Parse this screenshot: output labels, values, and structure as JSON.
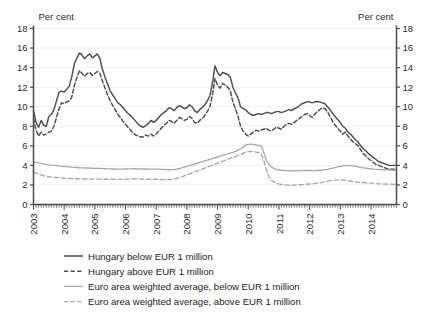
{
  "chart_data": {
    "type": "line",
    "title": "",
    "xlabel": "",
    "ylabel": "Per cent",
    "ylabel_left": "Per cent",
    "ylabel_right": "Per cent",
    "ylim": [
      0,
      18
    ],
    "ytick_values": [
      0,
      2,
      4,
      6,
      8,
      10,
      12,
      14,
      16,
      18
    ],
    "ytick_labels": [
      "0",
      "2",
      "4",
      "6",
      "8",
      "10",
      "12",
      "14",
      "16",
      "18"
    ],
    "xlim": [
      2003.0,
      2014.83
    ],
    "xtick_labels": [
      "2003",
      "2004",
      "2005",
      "2006",
      "2007",
      "2008",
      "2009",
      "2010",
      "2011",
      "2012",
      "2013",
      "2014"
    ],
    "xtick_values": [
      2003,
      2004,
      2005,
      2006,
      2007,
      2008,
      2009,
      2010,
      2011,
      2012,
      2013,
      2014
    ],
    "grid": true,
    "grid_axis": "y",
    "legend_position": "below",
    "x_minor_ticks": "monthly",
    "colors": {
      "hungary": "#4d4d4d",
      "euro_area": "#a8a8a8",
      "axis": "#4a4a4a",
      "grid": "#f0f0f0",
      "text": "#1c1c1c"
    },
    "series": [
      {
        "name": "Hungary below EUR 1 million",
        "color": "#4d4d4d",
        "style": "solid",
        "values": [
          9.6,
          8.4,
          7.9,
          8.6,
          8.1,
          8.0,
          9.0,
          9.2,
          9.7,
          10.6,
          11.5,
          11.6,
          11.5,
          11.8,
          12.1,
          13.1,
          14.4,
          15.0,
          15.5,
          15.3,
          14.9,
          15.2,
          15.4,
          15.0,
          15.2,
          15.4,
          14.9,
          13.8,
          13.0,
          12.3,
          11.6,
          11.2,
          10.8,
          10.4,
          10.2,
          9.9,
          9.6,
          9.3,
          9.1,
          8.8,
          8.5,
          8.2,
          8.0,
          7.9,
          8.1,
          8.3,
          8.6,
          8.4,
          8.6,
          8.9,
          9.2,
          9.4,
          9.6,
          9.9,
          9.8,
          9.6,
          9.9,
          10.1,
          10.0,
          9.8,
          9.9,
          10.2,
          10.0,
          9.6,
          9.4,
          9.7,
          9.9,
          10.2,
          10.6,
          11.1,
          12.4,
          14.2,
          13.5,
          13.2,
          13.5,
          13.4,
          13.3,
          13.0,
          12.0,
          11.4,
          10.9,
          10.0,
          9.8,
          9.7,
          9.4,
          9.2,
          9.1,
          9.2,
          9.3,
          9.2,
          9.3,
          9.4,
          9.4,
          9.3,
          9.4,
          9.5,
          9.5,
          9.4,
          9.5,
          9.6,
          9.7,
          9.6,
          9.8,
          9.9,
          10.1,
          10.3,
          10.4,
          10.5,
          10.5,
          10.4,
          10.5,
          10.5,
          10.5,
          10.4,
          10.3,
          10.0,
          9.7,
          9.3,
          9.0,
          8.7,
          8.4,
          8.0,
          7.8,
          7.4,
          7.2,
          6.9,
          6.6,
          6.4,
          6.0,
          5.7,
          5.5,
          5.2,
          5.0,
          4.8,
          4.6,
          4.4,
          4.3,
          4.2,
          4.1,
          4.0,
          4.0,
          4.0,
          4.0
        ]
      },
      {
        "name": "Hungary above EUR 1 million",
        "color": "#4d4d4d",
        "style": "dashed",
        "values": [
          8.8,
          7.6,
          7.0,
          7.4,
          7.1,
          7.2,
          7.4,
          7.5,
          8.0,
          8.9,
          9.8,
          10.4,
          10.3,
          10.5,
          10.6,
          11.0,
          12.2,
          13.0,
          13.7,
          13.4,
          13.1,
          13.4,
          13.5,
          13.2,
          13.4,
          13.6,
          13.4,
          12.6,
          11.9,
          11.2,
          10.6,
          10.1,
          9.7,
          9.2,
          8.9,
          8.5,
          8.2,
          7.9,
          7.6,
          7.3,
          7.1,
          7.0,
          6.9,
          6.9,
          7.1,
          7.0,
          7.2,
          7.0,
          7.2,
          7.5,
          7.8,
          8.1,
          8.3,
          8.6,
          8.5,
          8.3,
          8.6,
          8.9,
          8.8,
          8.6,
          8.7,
          9.0,
          8.8,
          8.4,
          8.3,
          8.6,
          8.8,
          9.1,
          9.5,
          10.0,
          11.2,
          12.9,
          12.2,
          11.9,
          12.4,
          12.2,
          12.0,
          11.6,
          10.5,
          9.8,
          9.0,
          8.0,
          7.5,
          7.2,
          7.0,
          7.2,
          7.4,
          7.6,
          7.5,
          7.6,
          7.7,
          7.8,
          7.6,
          7.5,
          7.7,
          7.9,
          7.8,
          7.7,
          8.0,
          8.2,
          8.3,
          8.2,
          8.4,
          8.6,
          8.8,
          9.0,
          9.2,
          9.3,
          9.1,
          8.9,
          9.2,
          9.5,
          9.7,
          9.9,
          9.8,
          9.5,
          9.0,
          8.5,
          8.1,
          7.8,
          7.5,
          7.2,
          7.4,
          7.0,
          6.7,
          6.4,
          6.2,
          6.0,
          5.6,
          5.2,
          5.0,
          4.7,
          4.5,
          4.3,
          4.1,
          4.0,
          3.9,
          3.8,
          3.7,
          3.6,
          3.6,
          3.6,
          3.5
        ]
      },
      {
        "name": "Euro area weighted average, below EUR 1 million",
        "color": "#a8a8a8",
        "style": "solid",
        "values": [
          4.35,
          4.3,
          4.25,
          4.2,
          4.15,
          4.1,
          4.05,
          4.02,
          4.0,
          3.98,
          3.95,
          3.92,
          3.9,
          3.88,
          3.85,
          3.82,
          3.8,
          3.78,
          3.76,
          3.75,
          3.74,
          3.73,
          3.72,
          3.71,
          3.7,
          3.69,
          3.68,
          3.67,
          3.66,
          3.65,
          3.64,
          3.63,
          3.63,
          3.62,
          3.62,
          3.62,
          3.63,
          3.64,
          3.65,
          3.66,
          3.66,
          3.65,
          3.64,
          3.63,
          3.63,
          3.62,
          3.62,
          3.62,
          3.62,
          3.61,
          3.6,
          3.58,
          3.56,
          3.55,
          3.56,
          3.58,
          3.62,
          3.68,
          3.74,
          3.82,
          3.9,
          3.98,
          4.06,
          4.14,
          4.22,
          4.3,
          4.38,
          4.46,
          4.54,
          4.62,
          4.7,
          4.78,
          4.86,
          4.94,
          5.02,
          5.1,
          5.18,
          5.26,
          5.34,
          5.44,
          5.56,
          5.7,
          5.85,
          6.1,
          6.15,
          6.18,
          6.15,
          6.1,
          6.05,
          6.0,
          5.4,
          4.6,
          4.1,
          3.85,
          3.7,
          3.6,
          3.55,
          3.5,
          3.48,
          3.46,
          3.45,
          3.44,
          3.44,
          3.45,
          3.46,
          3.47,
          3.48,
          3.48,
          3.48,
          3.47,
          3.47,
          3.48,
          3.5,
          3.52,
          3.56,
          3.6,
          3.66,
          3.72,
          3.78,
          3.84,
          3.9,
          3.95,
          3.98,
          4.0,
          3.98,
          3.95,
          3.9,
          3.85,
          3.8,
          3.76,
          3.72,
          3.68,
          3.65,
          3.62,
          3.6,
          3.58,
          3.56,
          3.55,
          3.54,
          3.53,
          3.52,
          3.51,
          3.5
        ]
      },
      {
        "name": "Euro area weighted average, above EUR 1 million",
        "color": "#a8a8a8",
        "style": "dashed",
        "values": [
          3.3,
          3.22,
          3.12,
          3.02,
          2.94,
          2.88,
          2.84,
          2.8,
          2.78,
          2.76,
          2.74,
          2.72,
          2.7,
          2.68,
          2.66,
          2.65,
          2.64,
          2.63,
          2.62,
          2.62,
          2.61,
          2.61,
          2.6,
          2.6,
          2.6,
          2.59,
          2.59,
          2.58,
          2.58,
          2.58,
          2.58,
          2.58,
          2.58,
          2.57,
          2.57,
          2.57,
          2.58,
          2.59,
          2.6,
          2.61,
          2.62,
          2.62,
          2.61,
          2.6,
          2.59,
          2.58,
          2.58,
          2.58,
          2.58,
          2.57,
          2.56,
          2.55,
          2.54,
          2.54,
          2.56,
          2.6,
          2.66,
          2.74,
          2.82,
          2.92,
          3.02,
          3.12,
          3.22,
          3.32,
          3.42,
          3.52,
          3.62,
          3.72,
          3.82,
          3.92,
          4.02,
          4.12,
          4.22,
          4.32,
          4.42,
          4.52,
          4.62,
          4.72,
          4.82,
          4.92,
          5.02,
          5.12,
          5.22,
          5.35,
          5.4,
          5.42,
          5.4,
          5.36,
          5.3,
          5.24,
          4.6,
          3.6,
          2.9,
          2.5,
          2.3,
          2.18,
          2.1,
          2.05,
          2.02,
          2.0,
          1.98,
          1.97,
          1.98,
          2.0,
          2.02,
          2.04,
          2.06,
          2.08,
          2.1,
          2.12,
          2.14,
          2.18,
          2.22,
          2.26,
          2.32,
          2.38,
          2.44,
          2.48,
          2.5,
          2.52,
          2.54,
          2.52,
          2.48,
          2.44,
          2.4,
          2.36,
          2.32,
          2.28,
          2.26,
          2.24,
          2.22,
          2.2,
          2.18,
          2.16,
          2.14,
          2.12,
          2.11,
          2.1,
          2.09,
          2.08,
          2.08,
          2.07,
          2.06
        ]
      }
    ]
  },
  "legend": {
    "items": [
      {
        "label": "Hungary below EUR 1 million",
        "color": "#4d4d4d",
        "style": "solid"
      },
      {
        "label": "Hungary above EUR 1 million",
        "color": "#4d4d4d",
        "style": "dashed"
      },
      {
        "label": "Euro area weighted average, below EUR 1 million",
        "color": "#a8a8a8",
        "style": "solid"
      },
      {
        "label": "Euro area weighted average, above EUR 1 million",
        "color": "#a8a8a8",
        "style": "dashed"
      }
    ]
  }
}
